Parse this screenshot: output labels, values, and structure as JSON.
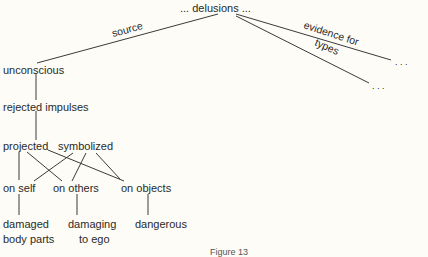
{
  "diagram": {
    "root": "... delusions ...",
    "edges_from_root": [
      {
        "label": "source",
        "target": "unconscious"
      },
      {
        "label": "evidence for",
        "target": "..."
      },
      {
        "label": "types",
        "target": "..."
      }
    ],
    "nodes": {
      "unconscious": "unconscious",
      "rejected_impulses": "rejected impulses",
      "projected": "projected",
      "symbolized": "symbolized",
      "on_self": "on self",
      "on_others": "on others",
      "on_objects": "on objects",
      "damaged_body_parts_1": "damaged",
      "damaged_body_parts_2": "body parts",
      "damaging_to_ego_1": "damaging",
      "damaging_to_ego_2": "to ego",
      "dangerous": "dangerous",
      "ellipsis_evidence": ". . .",
      "ellipsis_types": ". . ."
    },
    "caption": "Figure 13"
  }
}
